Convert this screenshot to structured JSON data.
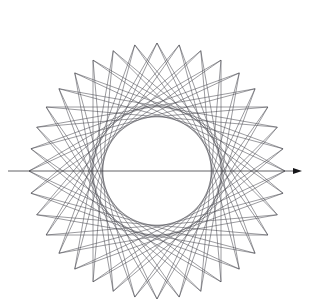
{
  "figure": {
    "canvas": {
      "width": 309,
      "height": 308,
      "background": "#ffffff"
    },
    "line_color": "#4a4a50",
    "axis_color": "#3a3a40",
    "arrow_color": "#151518",
    "line_width": 0.55,
    "axis_width": 0.8
  },
  "chart_data": {
    "type": "line",
    "xlabel": "",
    "ylabel": "",
    "grid": false,
    "legend": "none",
    "xlim": [
      0,
      309
    ],
    "ylim": [
      0,
      308
    ],
    "geometry": {
      "center_x": 157,
      "center_y": 171,
      "base_radius": 128,
      "num_points": 36,
      "chord_step": 13,
      "spike_extension": 1.0,
      "inner_envelope_radius": 47,
      "outer_tip_radius": 160,
      "angle_offset_deg": 0
    },
    "annotations": [
      {
        "name": "horizontal-axis-arrow",
        "kind": "arrow",
        "x1": 8,
        "y1": 171,
        "x2": 302,
        "y2": 171,
        "head_length": 9,
        "head_width": 6
      }
    ],
    "series": [
      {
        "name": "star-chords",
        "note": "36 chords, each from point i to point (i+13) mod 36 on the base circle, extended to form spike tips"
      }
    ]
  }
}
